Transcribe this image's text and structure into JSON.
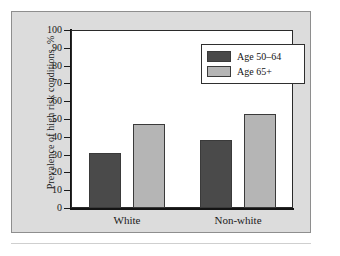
{
  "figure": {
    "background_color": "#dcdcdc",
    "plot_background_color": "#ffffff",
    "frame_color": "#8e8e8e",
    "axis_color": "#141414"
  },
  "chart_data": {
    "type": "bar",
    "title": "",
    "xlabel": "",
    "ylabel": "Prevalence of high risk conditions, %",
    "ylim": [
      0,
      100
    ],
    "yticks": [
      0,
      10,
      20,
      30,
      40,
      50,
      60,
      70,
      80,
      90,
      100
    ],
    "ytick_labels": [
      "0",
      "10",
      "20",
      "30",
      "40",
      "50",
      "60",
      "70",
      "80",
      "90",
      "100"
    ],
    "grid": false,
    "legend_position": "upper right",
    "categories": [
      "White",
      "Non-white"
    ],
    "series": [
      {
        "name": "Age 50–64",
        "color": "#4a4a4a",
        "values": [
          31,
          38
        ]
      },
      {
        "name": "Age 65+",
        "color": "#b5b5b5",
        "values": [
          47,
          53
        ]
      }
    ]
  }
}
